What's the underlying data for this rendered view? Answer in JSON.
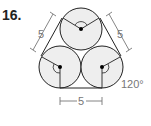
{
  "problem": {
    "number": "16.",
    "labels": {
      "left_side": "5",
      "right_side": "5",
      "bottom_side": "5",
      "angle": "120°"
    }
  },
  "colors": {
    "stroke": "#222222",
    "fill": "#eeeeee",
    "dim": "#777777"
  }
}
